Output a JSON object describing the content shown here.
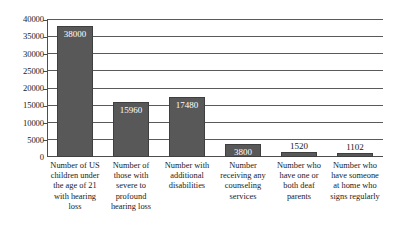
{
  "chart_data": {
    "type": "bar",
    "title": "",
    "subtitle": "",
    "xlabel": "",
    "ylabel": "",
    "ylim": [
      0,
      40000
    ],
    "ytick_interval": 5000,
    "yticks": [
      "40000",
      "35000",
      "30000",
      "25000",
      "20000",
      "15000",
      "10000",
      "5000",
      "0"
    ],
    "ytick_values": [
      40000,
      35000,
      30000,
      25000,
      20000,
      15000,
      10000,
      5000,
      0
    ],
    "grid": true,
    "grid_axis": "y",
    "legend": false,
    "legend_position": "none",
    "categories": [
      "Number of US children under the age of 21 with hearing loss",
      "Number of those with severe to profound hearing loss",
      "Number with additional disabilities",
      "Number receiving any counseling services",
      "Number who have one or both deaf parents",
      "Number who have someone at home who signs regularly"
    ],
    "values": [
      38000,
      15960,
      17480,
      3800,
      1520,
      1102
    ],
    "value_labels": [
      "38000",
      "15960",
      "17480",
      "3800",
      "1520",
      "1102"
    ],
    "label_placement": [
      "inside",
      "inside",
      "inside",
      "inside",
      "above",
      "above"
    ],
    "bar_color": "#585858",
    "bar_border_color": "#3f3f3f",
    "inside_label_color": "#ffffff",
    "above_label_color": "#1a1a1a",
    "axis_color": "#4d4d4d",
    "grid_color": "#5a5a5a",
    "background_color": "#ffffff"
  }
}
